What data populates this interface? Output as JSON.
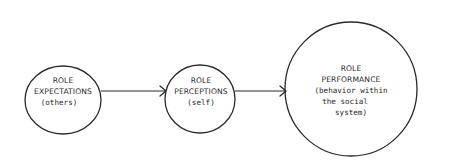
{
  "diagram": {
    "type": "flow",
    "nodes": [
      {
        "id": "role-expectations",
        "title_lines": [
          "ROLE",
          "EXPECTATIONS"
        ],
        "sub_lines": [
          "(others)"
        ]
      },
      {
        "id": "role-perceptions",
        "title_lines": [
          "ROLE",
          "PERCEPTIONS"
        ],
        "sub_lines": [
          "(self)"
        ]
      },
      {
        "id": "role-performance",
        "title_lines": [
          "ROLE",
          "PERFORMANCE"
        ],
        "sub_lines": [
          "(behavior within",
          "the social",
          "system)"
        ]
      }
    ],
    "edges": [
      {
        "from": "role-expectations",
        "to": "role-perceptions"
      },
      {
        "from": "role-perceptions",
        "to": "role-performance"
      }
    ],
    "colors": {
      "ink": "#2a2a2a",
      "background": "#ffffff"
    }
  }
}
